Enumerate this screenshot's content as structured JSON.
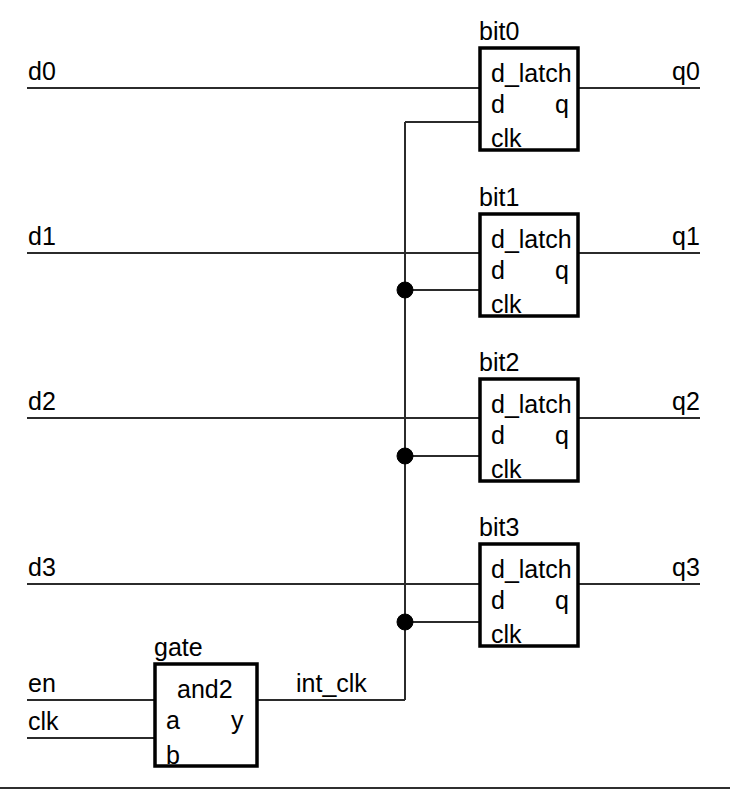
{
  "diagram": {
    "background_color": "#ffffff",
    "line_color": "#000000"
  },
  "inputs": [
    {
      "name": "d0",
      "x": 28,
      "y": 72
    },
    {
      "name": "d1",
      "x": 28,
      "y": 237
    },
    {
      "name": "d2",
      "x": 28,
      "y": 402
    },
    {
      "name": "d3",
      "x": 28,
      "y": 567
    },
    {
      "name": "en",
      "x": 28,
      "y": 685
    },
    {
      "name": "clk",
      "x": 28,
      "y": 723
    }
  ],
  "outputs": [
    {
      "name": "q0",
      "x": 672,
      "y": 72
    },
    {
      "name": "q1",
      "x": 672,
      "y": 237
    },
    {
      "name": "q2",
      "x": 672,
      "y": 402
    },
    {
      "name": "q3",
      "x": 672,
      "y": 567
    }
  ],
  "nets": [
    {
      "name": "int_clk",
      "x": 296,
      "y": 685
    }
  ],
  "latches": [
    {
      "instance": "bit0",
      "type": "d_latch",
      "ports": {
        "d": "d",
        "q": "q",
        "clk": "clk"
      },
      "box": {
        "x": 480,
        "y": 48,
        "w": 98,
        "h": 102
      }
    },
    {
      "instance": "bit1",
      "type": "d_latch",
      "ports": {
        "d": "d",
        "q": "q",
        "clk": "clk"
      },
      "box": {
        "x": 480,
        "y": 214,
        "w": 98,
        "h": 102
      }
    },
    {
      "instance": "bit2",
      "type": "d_latch",
      "ports": {
        "d": "d",
        "q": "q",
        "clk": "clk"
      },
      "box": {
        "x": 480,
        "y": 379,
        "w": 98,
        "h": 102
      }
    },
    {
      "instance": "bit3",
      "type": "d_latch",
      "ports": {
        "d": "d",
        "q": "q",
        "clk": "clk"
      },
      "box": {
        "x": 480,
        "y": 544,
        "w": 98,
        "h": 102
      }
    }
  ],
  "gate": {
    "instance": "gate",
    "type": "and2",
    "ports": {
      "a": "a",
      "b": "b",
      "y": "y"
    },
    "box": {
      "x": 155,
      "y": 664,
      "w": 102,
      "h": 102
    }
  },
  "labels": {
    "bit0_instance": "bit0",
    "bit1_instance": "bit1",
    "bit2_instance": "bit2",
    "bit3_instance": "bit3",
    "bit0_type": "d_latch",
    "bit1_type": "d_latch",
    "bit2_type": "d_latch",
    "bit3_type": "d_latch",
    "port_d": "d",
    "port_q": "q",
    "port_clk": "clk",
    "gate_instance": "gate",
    "gate_type": "and2",
    "gate_port_a": "a",
    "gate_port_b": "b",
    "gate_port_y": "y",
    "net_int_clk": "int_clk",
    "in_d0": "d0",
    "in_d1": "d1",
    "in_d2": "d2",
    "in_d3": "d3",
    "in_en": "en",
    "in_clk": "clk",
    "out_q0": "q0",
    "out_q1": "q1",
    "out_q2": "q2",
    "out_q3": "q3"
  },
  "junctions": [
    {
      "net": "int_clk",
      "x": 405,
      "y": 290
    },
    {
      "net": "int_clk",
      "x": 405,
      "y": 456
    },
    {
      "net": "int_clk",
      "x": 405,
      "y": 622
    }
  ]
}
